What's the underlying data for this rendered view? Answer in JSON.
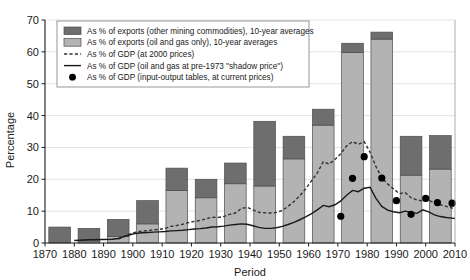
{
  "chart_data": {
    "type": "bar",
    "title": "",
    "xlabel": "Period",
    "ylabel": "Percentage",
    "ylim": [
      0,
      70
    ],
    "xlim": [
      1870,
      2010
    ],
    "yticks": [
      0,
      10,
      20,
      30,
      40,
      50,
      60,
      70
    ],
    "xticks": [
      1870,
      1880,
      1890,
      1900,
      1910,
      1920,
      1930,
      1940,
      1950,
      1960,
      1970,
      1980,
      1990,
      2000,
      2010
    ],
    "grid": true,
    "legend_position": "top-left",
    "categories": [
      1875,
      1885,
      1895,
      1905,
      1915,
      1925,
      1935,
      1945,
      1955,
      1965,
      1975,
      1985,
      1995,
      2005
    ],
    "series": [
      {
        "name": "As % of exports (oil and gas only), 10-year averages",
        "type": "bar-segment",
        "color": "#b3b3b3",
        "values": [
          0.0,
          0.6,
          2.0,
          6.0,
          16.5,
          14.2,
          18.6,
          17.9,
          26.4,
          37.0,
          59.8,
          64.0,
          21.3,
          23.2
        ]
      },
      {
        "name": "As % of exports (other mining commodities), 10-year averages",
        "type": "bar-segment",
        "color": "#6e6e6e",
        "values": [
          5.0,
          4.0,
          5.4,
          7.3,
          7.0,
          5.8,
          6.5,
          20.3,
          7.1,
          5.0,
          2.9,
          2.2,
          12.2,
          10.5
        ]
      },
      {
        "name": "As % of GDP (at 2000 prices)",
        "type": "line-dashed",
        "color": "#333333",
        "points": [
          [
            1895,
            1.2
          ],
          [
            1897,
            2.1
          ],
          [
            1899,
            2.8
          ],
          [
            1901,
            3.4
          ],
          [
            1903,
            3.7
          ],
          [
            1905,
            3.9
          ],
          [
            1907,
            4.1
          ],
          [
            1909,
            4.3
          ],
          [
            1911,
            4.6
          ],
          [
            1913,
            5.2
          ],
          [
            1915,
            5.5
          ],
          [
            1917,
            5.9
          ],
          [
            1919,
            6.4
          ],
          [
            1921,
            6.8
          ],
          [
            1923,
            7.1
          ],
          [
            1925,
            7.6
          ],
          [
            1927,
            8.1
          ],
          [
            1929,
            8.0
          ],
          [
            1931,
            8.3
          ],
          [
            1933,
            9.0
          ],
          [
            1935,
            9.4
          ],
          [
            1937,
            10.8
          ],
          [
            1939,
            11.2
          ],
          [
            1941,
            10.4
          ],
          [
            1943,
            9.6
          ],
          [
            1945,
            9.5
          ],
          [
            1947,
            9.4
          ],
          [
            1949,
            9.6
          ],
          [
            1951,
            10.2
          ],
          [
            1953,
            11.5
          ],
          [
            1955,
            13.0
          ],
          [
            1957,
            14.8
          ],
          [
            1959,
            17.0
          ],
          [
            1961,
            19.5
          ],
          [
            1963,
            22.0
          ],
          [
            1965,
            25.5
          ],
          [
            1967,
            24.8
          ],
          [
            1969,
            26.2
          ],
          [
            1971,
            28.0
          ],
          [
            1973,
            30.5
          ],
          [
            1975,
            31.8
          ],
          [
            1977,
            31.0
          ],
          [
            1979,
            31.8
          ],
          [
            1981,
            28.5
          ],
          [
            1983,
            24.0
          ],
          [
            1985,
            20.5
          ],
          [
            1987,
            18.5
          ],
          [
            1989,
            17.0
          ],
          [
            1991,
            15.5
          ],
          [
            1993,
            15.8
          ],
          [
            1995,
            14.2
          ],
          [
            1997,
            13.5
          ],
          [
            1999,
            13.2
          ],
          [
            2001,
            13.4
          ],
          [
            2003,
            12.6
          ],
          [
            2005,
            12.0
          ],
          [
            2007,
            11.5
          ],
          [
            2009,
            11.0
          ],
          [
            2010,
            10.8
          ]
        ]
      },
      {
        "name": "As % of GDP (oil and gas at pre-1973 \"shadow price\")",
        "type": "line-solid",
        "color": "#1a1a1a",
        "points": [
          [
            1880,
            0.8
          ],
          [
            1885,
            1.0
          ],
          [
            1890,
            1.1
          ],
          [
            1893,
            1.2
          ],
          [
            1895,
            1.4
          ],
          [
            1897,
            2.0
          ],
          [
            1899,
            2.6
          ],
          [
            1901,
            3.0
          ],
          [
            1903,
            3.2
          ],
          [
            1905,
            3.3
          ],
          [
            1907,
            3.4
          ],
          [
            1909,
            3.5
          ],
          [
            1911,
            3.6
          ],
          [
            1913,
            3.8
          ],
          [
            1915,
            3.9
          ],
          [
            1917,
            4.0
          ],
          [
            1919,
            4.2
          ],
          [
            1921,
            4.4
          ],
          [
            1923,
            4.5
          ],
          [
            1925,
            4.7
          ],
          [
            1927,
            5.0
          ],
          [
            1929,
            5.1
          ],
          [
            1931,
            5.3
          ],
          [
            1933,
            5.6
          ],
          [
            1935,
            5.8
          ],
          [
            1937,
            6.0
          ],
          [
            1939,
            5.9
          ],
          [
            1941,
            5.4
          ],
          [
            1943,
            4.9
          ],
          [
            1945,
            4.6
          ],
          [
            1947,
            4.6
          ],
          [
            1949,
            4.8
          ],
          [
            1951,
            5.2
          ],
          [
            1953,
            5.8
          ],
          [
            1955,
            6.5
          ],
          [
            1957,
            7.3
          ],
          [
            1959,
            8.2
          ],
          [
            1961,
            9.2
          ],
          [
            1963,
            10.4
          ],
          [
            1965,
            11.8
          ],
          [
            1967,
            11.4
          ],
          [
            1969,
            12.0
          ],
          [
            1971,
            13.2
          ],
          [
            1973,
            15.0
          ],
          [
            1975,
            16.5
          ],
          [
            1977,
            16.1
          ],
          [
            1979,
            17.2
          ],
          [
            1981,
            17.5
          ],
          [
            1983,
            14.0
          ],
          [
            1985,
            11.5
          ],
          [
            1987,
            10.3
          ],
          [
            1989,
            9.8
          ],
          [
            1991,
            9.5
          ],
          [
            1993,
            10.0
          ],
          [
            1995,
            9.6
          ],
          [
            1997,
            9.3
          ],
          [
            1999,
            10.4
          ],
          [
            2001,
            9.8
          ],
          [
            2003,
            8.8
          ],
          [
            2005,
            8.3
          ],
          [
            2007,
            8.0
          ],
          [
            2009,
            7.8
          ],
          [
            2010,
            7.7
          ]
        ]
      },
      {
        "name": "As % of GDP (input-output tables, at current prices)",
        "type": "scatter",
        "color": "#000000",
        "points": [
          [
            1971,
            8.4
          ],
          [
            1975,
            20.3
          ],
          [
            1979,
            27.1
          ],
          [
            1985,
            20.4
          ],
          [
            1990,
            13.3
          ],
          [
            1995,
            9.0
          ],
          [
            2000,
            14.0
          ],
          [
            2004,
            12.7
          ],
          [
            2009,
            12.5
          ]
        ]
      }
    ],
    "legend": [
      {
        "label": "As % of exports (other mining commodities), 10-year averages",
        "marker": "swatch-dark",
        "color": "#6e6e6e"
      },
      {
        "label": "As % of exports (oil and gas only), 10-year averages",
        "marker": "swatch-light",
        "color": "#b3b3b3"
      },
      {
        "label": "As % of GDP (at 2000 prices)",
        "marker": "line-dashed",
        "color": "#333333"
      },
      {
        "label": "As % of GDP (oil and gas at pre-1973 \"shadow price\")",
        "marker": "line-solid",
        "color": "#1a1a1a"
      },
      {
        "label": "As % of GDP (input-output tables, at current prices)",
        "marker": "dot",
        "color": "#000000"
      }
    ]
  }
}
